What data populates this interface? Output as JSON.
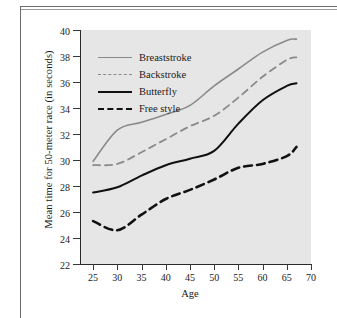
{
  "chart_data": {
    "type": "line",
    "title": "",
    "subtitle": "",
    "xlabel": "Age",
    "ylabel": "Mean time for 50-meter race (in seconds)",
    "xlim": [
      22.5,
      70
    ],
    "ylim": [
      22,
      40
    ],
    "xticks": [
      25,
      30,
      35,
      40,
      45,
      50,
      55,
      60,
      65,
      70
    ],
    "yticks": [
      22,
      24,
      26,
      28,
      30,
      32,
      34,
      36,
      38,
      40
    ],
    "grid": false,
    "legend_position": "upper-left-inside",
    "plot_background": "#e6e6e6",
    "x": [
      25,
      30,
      35,
      40,
      45,
      50,
      55,
      60,
      65,
      67
    ],
    "series": [
      {
        "name": "Breaststroke",
        "color": "#8a8a8a",
        "style": "solid",
        "values": [
          29.9,
          32.3,
          32.9,
          33.5,
          34.2,
          35.7,
          37.0,
          38.3,
          39.2,
          39.3
        ]
      },
      {
        "name": "Backstroke",
        "color": "#8a8a8a",
        "style": "dashed",
        "values": [
          29.6,
          29.7,
          30.6,
          31.6,
          32.6,
          33.4,
          34.8,
          36.4,
          37.7,
          37.9
        ]
      },
      {
        "name": "Butterfly",
        "color": "#111111",
        "style": "solid",
        "values": [
          27.5,
          27.9,
          28.8,
          29.6,
          30.1,
          30.7,
          32.8,
          34.6,
          35.7,
          35.9
        ]
      },
      {
        "name": "Free style",
        "color": "#111111",
        "style": "dashed-bold",
        "values": [
          25.3,
          24.6,
          25.8,
          27.0,
          27.7,
          28.5,
          29.4,
          29.7,
          30.3,
          31.0
        ]
      }
    ]
  },
  "axes": {
    "x_tick_labels": [
      "25",
      "30",
      "35",
      "40",
      "45",
      "50",
      "55",
      "60",
      "65",
      "70"
    ],
    "y_tick_labels": [
      "22",
      "24",
      "26",
      "28",
      "30",
      "32",
      "34",
      "36",
      "38",
      "40"
    ],
    "x_axis_label": "Age",
    "y_axis_label": "Mean time for 50-meter race (in seconds)"
  },
  "legend": {
    "items": [
      {
        "label": "Breaststroke"
      },
      {
        "label": "Backstroke"
      },
      {
        "label": "Butterfly"
      },
      {
        "label": "Free style"
      }
    ]
  }
}
